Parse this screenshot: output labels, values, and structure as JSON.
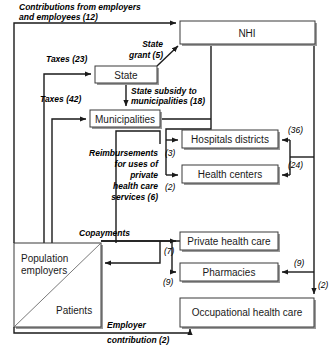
{
  "diagram": {
    "nodes": [
      {
        "id": "nhi",
        "label": "NHI"
      },
      {
        "id": "state",
        "label": "State"
      },
      {
        "id": "munis",
        "label": "Municipalities"
      },
      {
        "id": "hospitals",
        "label": "Hospitals districts"
      },
      {
        "id": "centers",
        "label": "Health centers"
      },
      {
        "id": "private",
        "label": "Private health care"
      },
      {
        "id": "pharma",
        "label": "Pharmacies"
      },
      {
        "id": "occ",
        "label": "Occupational health care"
      },
      {
        "id": "pop_a",
        "label": "Population"
      },
      {
        "id": "pop_b",
        "label": "employers"
      },
      {
        "id": "pop_c",
        "label": "Patients"
      }
    ],
    "flows": {
      "contributions_l1": "Contributions from employers",
      "contributions_l2": "and employees (12)",
      "state_grant_l1": "State",
      "state_grant_l2": "grant (5)",
      "taxes_23": "Taxes (23)",
      "taxes_42": "Taxes (42)",
      "subsidy_l1": "State subsidy to",
      "subsidy_l2": "municipalities (18)",
      "reimb_l1": "Reimbursements",
      "reimb_l2": "for uses of",
      "reimb_l3": "private",
      "reimb_l4": "health care",
      "reimb_l5": "services (6)",
      "copayments": "Copayments",
      "employer_l1": "Employer",
      "employer_l2": "contribution (2)"
    },
    "amounts": {
      "hospitals_in": "(36)",
      "centers_in": "(24)",
      "hospitals_muni": "(3)",
      "centers_muni": "(2)",
      "private_copay": "(7)",
      "pharma_copay": "(9)",
      "pharma_nhi": "(9)",
      "occ_nhi": "(2)"
    },
    "colors": {
      "line": "#1a1a1a",
      "box_stroke": "#3a3a3a",
      "shadow": "#9a9a9a",
      "background": "#ffffff"
    }
  }
}
